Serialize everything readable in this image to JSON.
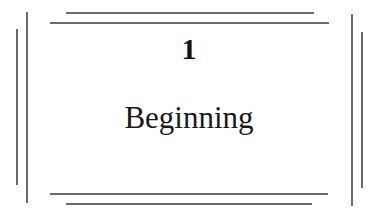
{
  "chapter": {
    "number": "1",
    "title": "Beginning"
  },
  "colors": {
    "rule": "#6a6a6a",
    "text": "#111111",
    "background": "#ffffff"
  }
}
